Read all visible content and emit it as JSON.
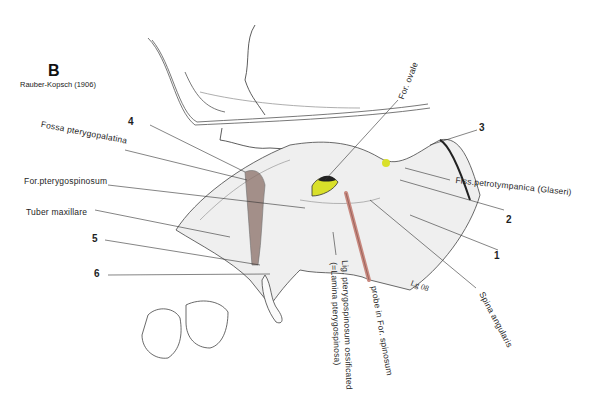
{
  "figure": {
    "panel_letter": "B",
    "source": "Rauber-Kopsch (1906)",
    "signature": "Lg 08"
  },
  "labels": {
    "fossa_pterygopalatina": "Fossa pterygopalatina",
    "for_pterygospinosum": "For.pterygospinosum",
    "tuber_maxillare": "Tuber maxillare",
    "for_ovale": "For. ovale",
    "fiss_petrotympanica": "Fiss.petrotympanica (Glaseri)",
    "spina_angularis": "Spina angularis",
    "probe": "probe in For. spinosum",
    "lig_line1": "Lig. pterygospinosum ossificated",
    "lig_line2": "(=Lamina pterygospinosa)"
  },
  "numbers": {
    "n1": "1",
    "n2": "2",
    "n3": "3",
    "n4": "4",
    "n5": "5",
    "n6": "6"
  },
  "colors": {
    "probe": "#c98a80",
    "foramen_ovale_fill": "#d9e02a",
    "fossa_shade": "#8a7068",
    "line": "#333333"
  }
}
